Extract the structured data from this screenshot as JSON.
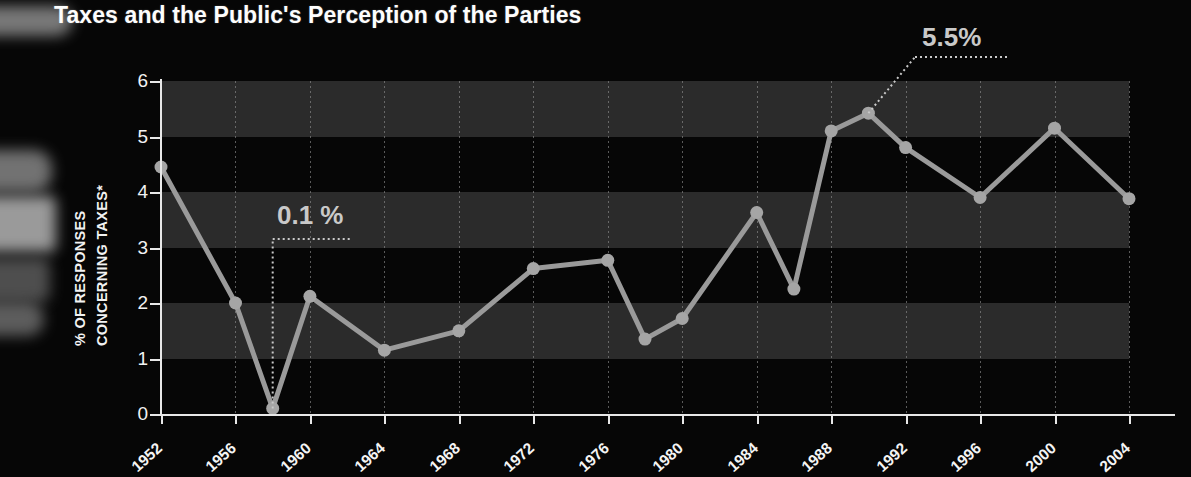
{
  "title": "Taxes and the Public's Perception of the Parties",
  "axis": {
    "ylabel_line1": "% OF RESPONSES",
    "ylabel_line2": "CONCERNING TAXES*"
  },
  "annotations": [
    {
      "id": "low",
      "text": "0.1 %",
      "year": 1958,
      "value": 0.1
    },
    {
      "id": "high",
      "text": "5.5%",
      "year": 1990,
      "value": 5.5
    }
  ],
  "colors": {
    "background": "#060606",
    "band": "#2b2b2b",
    "line": "#9a9a9a",
    "marker": "#a5a5a5",
    "axis": "#e8e8e8",
    "text": "#f4f4f4",
    "annotation": "#c9c9c9"
  },
  "chart_data": {
    "type": "line",
    "title": "Taxes and the Public's Perception of the Parties",
    "xlabel": "",
    "ylabel": "% OF RESPONSES CONCERNING TAXES*",
    "xlim": [
      1952,
      2004
    ],
    "ylim": [
      0,
      6
    ],
    "ytick_labels": [
      "0",
      "1",
      "2",
      "3",
      "4",
      "5",
      "6"
    ],
    "yticks": [
      0,
      1,
      2,
      3,
      4,
      5,
      6
    ],
    "xtick_labels": [
      "1952",
      "1956",
      "1960",
      "1964",
      "1968",
      "1972",
      "1976",
      "1980",
      "1984",
      "1988",
      "1992",
      "1996",
      "2000",
      "2004"
    ],
    "xticks": [
      1952,
      1956,
      1960,
      1964,
      1968,
      1972,
      1976,
      1980,
      1984,
      1988,
      1992,
      1996,
      2000,
      2004
    ],
    "grid": "vertical-dotted",
    "banding": "alternating horizontal bands each 1 unit",
    "legend": "none",
    "x": [
      1952,
      1956,
      1958,
      1960,
      1964,
      1968,
      1972,
      1976,
      1978,
      1980,
      1984,
      1986,
      1988,
      1990,
      1992,
      1996,
      2000,
      2004
    ],
    "values": [
      4.45,
      2.0,
      0.1,
      2.12,
      1.15,
      1.5,
      2.62,
      2.77,
      1.35,
      1.72,
      3.63,
      2.25,
      5.1,
      5.42,
      4.8,
      3.9,
      5.15,
      3.88
    ],
    "series": [
      {
        "name": "% of responses concerning taxes",
        "points": [
          {
            "year": 1952,
            "value": 4.45
          },
          {
            "year": 1956,
            "value": 2.0
          },
          {
            "year": 1958,
            "value": 0.1
          },
          {
            "year": 1960,
            "value": 2.12
          },
          {
            "year": 1964,
            "value": 1.15
          },
          {
            "year": 1968,
            "value": 1.5
          },
          {
            "year": 1972,
            "value": 2.62
          },
          {
            "year": 1976,
            "value": 2.77
          },
          {
            "year": 1978,
            "value": 1.35
          },
          {
            "year": 1980,
            "value": 1.72
          },
          {
            "year": 1984,
            "value": 3.63
          },
          {
            "year": 1986,
            "value": 2.25
          },
          {
            "year": 1988,
            "value": 5.1
          },
          {
            "year": 1990,
            "value": 5.42
          },
          {
            "year": 1992,
            "value": 4.8
          },
          {
            "year": 1996,
            "value": 3.9
          },
          {
            "year": 2000,
            "value": 5.15
          },
          {
            "year": 2004,
            "value": 3.88
          }
        ]
      }
    ]
  }
}
